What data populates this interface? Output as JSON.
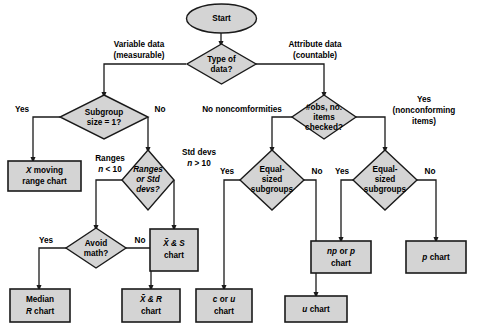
{
  "figure": {
    "type": "flowchart",
    "caption": "",
    "colors": {
      "shape_fill": "#d4d4d4",
      "shape_stroke": "#1a1a1a",
      "background": "#ffffff",
      "text": "#000000"
    }
  },
  "nodes": {
    "start": {
      "label": "Start",
      "shape": "ellipse"
    },
    "type_of_data": {
      "line1": "Type of",
      "line2": "data?",
      "shape": "diamond"
    },
    "subgroup_size": {
      "line1": "Subgroup",
      "line2": "size = 1?",
      "shape": "diamond"
    },
    "x_moving_range": {
      "line1": "X moving",
      "line2": "range chart",
      "shape": "box"
    },
    "ranges_or_std": {
      "line1": "Ranges",
      "line2": "or Std",
      "line3": "devs?",
      "shape": "diamond"
    },
    "avoid_math": {
      "line1": "Avoid",
      "line2": "math?",
      "shape": "diamond"
    },
    "median_r_chart": {
      "line1": "Median",
      "line2": "R chart",
      "shape": "box"
    },
    "xbar_r_chart": {
      "line1": "X̄ & R",
      "line2": "chart",
      "shape": "box"
    },
    "xbar_s_chart": {
      "line1": "X̄ & S",
      "line2": "chart",
      "shape": "box"
    },
    "obs_items_checked": {
      "line1": "#obs, no.",
      "line2": "items",
      "line3": "checked?",
      "shape": "diamond"
    },
    "equal_sized_left": {
      "line1": "Equal-",
      "line2": "sized",
      "line3": "subgroups",
      "shape": "diamond"
    },
    "equal_sized_right": {
      "line1": "Equal-",
      "line2": "sized",
      "line3": "subgroups",
      "shape": "diamond"
    },
    "c_or_u_chart": {
      "line1": "c or u",
      "line2": "chart",
      "shape": "box"
    },
    "u_chart": {
      "label": "u chart",
      "shape": "box"
    },
    "np_or_p_chart": {
      "line1": "np or p",
      "line2": "chart",
      "shape": "box"
    },
    "p_chart": {
      "label": "p chart",
      "shape": "box"
    }
  },
  "edge_labels": {
    "variable_data_l1": "Variable data",
    "variable_data_l2": "(measurable)",
    "attribute_data_l1": "Attribute data",
    "attribute_data_l2": "(countable)",
    "subgroup_yes": "Yes",
    "subgroup_no": "No",
    "ranges_l1": "Ranges",
    "ranges_l2": "n < 10",
    "std_devs_l1": "Std devs",
    "std_devs_l2": "n > 10",
    "avoid_yes": "Yes",
    "avoid_no": "No",
    "no_noncomformities": "No noncomformities",
    "yes_nonconforming_l1": "Yes",
    "yes_nonconforming_l2": "(nonconforming",
    "yes_nonconforming_l3": "items)",
    "equal_left_yes": "Yes",
    "equal_left_no": "No",
    "equal_right_yes": "Yes",
    "equal_right_no": "No"
  }
}
